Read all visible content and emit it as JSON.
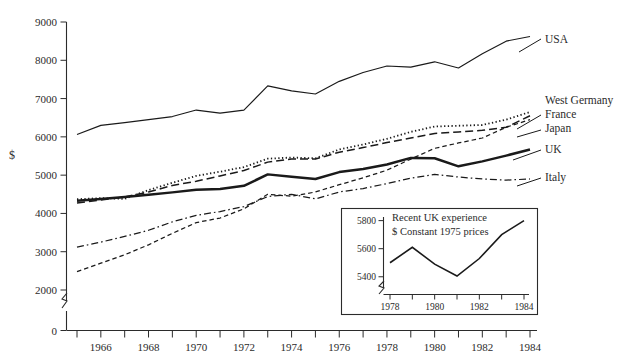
{
  "axes": {
    "y_label": "$",
    "y_ticks": [
      "0",
      "2000",
      "3000",
      "4000",
      "5000",
      "6000",
      "7000",
      "8000",
      "9000"
    ],
    "x_ticks": [
      "1966",
      "1968",
      "1970",
      "1972",
      "1974",
      "1976",
      "1978",
      "1980",
      "1982",
      "1984"
    ]
  },
  "series_labels": {
    "usa": "USA",
    "west_germany": "West Germany",
    "france": "France",
    "japan": "Japan",
    "uk": "UK",
    "italy": "Italy"
  },
  "inset": {
    "title_line1": "Recent UK experience",
    "title_line2": "$  Constant 1975 prices",
    "y_ticks": [
      "5400",
      "5600",
      "5800"
    ],
    "x_ticks": [
      "1978",
      "1980",
      "1982",
      "1984"
    ]
  },
  "chart_data": {
    "type": "line",
    "title": "",
    "xlabel": "",
    "ylabel": "$",
    "xlim": [
      1965,
      1984
    ],
    "ylim": [
      2000,
      9000
    ],
    "y_break_below": 2000,
    "grid": false,
    "legend": "right-of-plot-end-labels",
    "x": [
      1965,
      1966,
      1967,
      1968,
      1969,
      1970,
      1971,
      1972,
      1973,
      1974,
      1975,
      1976,
      1977,
      1978,
      1979,
      1980,
      1981,
      1982,
      1983,
      1984
    ],
    "series": [
      {
        "name": "USA",
        "style": "solid-thin",
        "values": [
          6060,
          6300,
          6370,
          6450,
          6530,
          6700,
          6620,
          6700,
          7330,
          7200,
          7120,
          7450,
          7680,
          7850,
          7820,
          7960,
          7800,
          8170,
          8500,
          8620
        ]
      },
      {
        "name": "West Germany",
        "style": "dotted",
        "values": [
          4370,
          4400,
          4380,
          4610,
          4800,
          4980,
          5090,
          5210,
          5430,
          5460,
          5440,
          5670,
          5800,
          5950,
          6130,
          6270,
          6290,
          6310,
          6450,
          6650
        ]
      },
      {
        "name": "France",
        "style": "long-dash",
        "values": [
          4270,
          4350,
          4430,
          4560,
          4730,
          4840,
          4980,
          5120,
          5340,
          5420,
          5420,
          5600,
          5720,
          5850,
          5970,
          6090,
          6130,
          6170,
          6250,
          6550
        ]
      },
      {
        "name": "Japan",
        "style": "short-dash",
        "values": [
          2480,
          2700,
          2920,
          3180,
          3480,
          3760,
          3880,
          4120,
          4500,
          4450,
          4560,
          4750,
          4930,
          5130,
          5420,
          5700,
          5840,
          5970,
          6250,
          6450
        ]
      },
      {
        "name": "UK",
        "style": "solid-thick",
        "values": [
          4330,
          4380,
          4430,
          4490,
          4550,
          4620,
          4640,
          4720,
          5020,
          4960,
          4900,
          5080,
          5160,
          5280,
          5450,
          5440,
          5230,
          5360,
          5510,
          5670
        ]
      },
      {
        "name": "Italy",
        "style": "dash-dot",
        "values": [
          3120,
          3250,
          3400,
          3560,
          3780,
          3950,
          4050,
          4180,
          4440,
          4500,
          4380,
          4560,
          4650,
          4780,
          4920,
          5020,
          4950,
          4900,
          4870,
          4900
        ]
      }
    ]
  },
  "inset_data": {
    "type": "line",
    "title": "Recent UK experience",
    "subtitle": "$  Constant 1975 prices",
    "xlabel": "",
    "ylabel": "",
    "xlim": [
      1978,
      1984
    ],
    "ylim": [
      5320,
      5840
    ],
    "grid": false,
    "x": [
      1978,
      1979,
      1980,
      1981,
      1982,
      1983,
      1984
    ],
    "values": [
      5500,
      5610,
      5490,
      5405,
      5530,
      5700,
      5800
    ]
  }
}
